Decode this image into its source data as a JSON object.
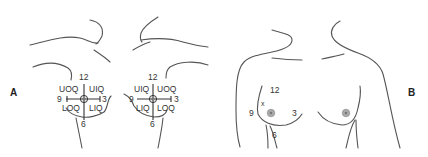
{
  "panels": {
    "a": {
      "label": "A",
      "left_breast": {
        "clock": {
          "top": "12",
          "left": "9",
          "right": "3",
          "bottom": "6"
        },
        "quadrants": {
          "upper_left": "UOQ",
          "upper_right": "UIQ",
          "lower_left": "LOQ",
          "lower_right": "LIQ"
        }
      },
      "right_breast": {
        "clock": {
          "top": "12",
          "left": "9",
          "right": "3",
          "bottom": "6"
        },
        "quadrants": {
          "upper_left": "UIQ",
          "upper_right": "UOQ",
          "lower_left": "LIQ",
          "lower_right": "LOQ"
        }
      }
    },
    "b": {
      "label": "B",
      "clock": {
        "top": "12",
        "left": "9",
        "right": "3",
        "bottom": "6"
      },
      "lesion_marker": "x"
    }
  },
  "colors": {
    "line": "#555555",
    "text": "#333333",
    "nipple": "#aaaaaa"
  }
}
